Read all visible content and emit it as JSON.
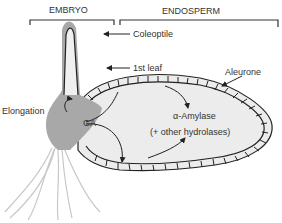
{
  "diagram": {
    "sections": {
      "embryo": "EMBRYO",
      "endosperm": "ENDOSPERM"
    },
    "labels": {
      "coleoptile": "Coleoptile",
      "first_leaf": "1st leaf",
      "aleurone": "Aleurone",
      "elongation": "Elongation",
      "ga": "GA",
      "amylase": "α-Amylase",
      "hydrolases": "(+ other hydrolases)"
    },
    "colors": {
      "embryo_fill": "#a8a8a8",
      "endosperm_fill": "#ececec",
      "outline": "#222222",
      "text": "#333333",
      "roots": "#c8c8c8"
    }
  }
}
